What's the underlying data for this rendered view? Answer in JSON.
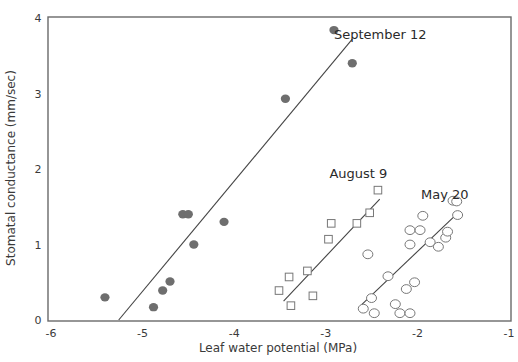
{
  "chart_data": {
    "type": "scatter",
    "title": "",
    "xlabel": "Leaf water potential (MPa)",
    "ylabel": "Stomatal conductance (mm/sec)",
    "xlim": [
      -6,
      -1
    ],
    "ylim": [
      0,
      4
    ],
    "xticks": [
      -6,
      -5,
      -4,
      -3,
      -2,
      -1
    ],
    "yticks": [
      0,
      1,
      2,
      3,
      4
    ],
    "xtick_labels": [
      "-6",
      "-5",
      "-4",
      "-3",
      "-2",
      "-1"
    ],
    "ytick_labels": [
      "0",
      "1",
      "2",
      "3",
      "4"
    ],
    "grid": false,
    "legend": "none (series labeled inline next to regression lines)",
    "series": [
      {
        "name": "September 12",
        "marker": "filled-circle",
        "color": "#6e6e6e",
        "label_pos": [
          -2.9,
          3.72
        ],
        "fit_line": [
          [
            -5.25,
            0.0
          ],
          [
            -2.7,
            3.72
          ]
        ],
        "points": [
          [
            -5.4,
            0.3
          ],
          [
            -4.87,
            0.17
          ],
          [
            -4.77,
            0.39
          ],
          [
            -4.69,
            0.51
          ],
          [
            -4.55,
            1.4
          ],
          [
            -4.49,
            1.4
          ],
          [
            -4.43,
            1.0
          ],
          [
            -4.1,
            1.3
          ],
          [
            -3.43,
            2.93
          ],
          [
            -2.9,
            3.84
          ],
          [
            -2.7,
            3.4
          ]
        ]
      },
      {
        "name": "August 9",
        "marker": "open-square",
        "color": "#777777",
        "label_pos": [
          -2.95,
          1.88
        ],
        "fit_line": [
          [
            -3.45,
            0.25
          ],
          [
            -2.4,
            1.6
          ]
        ],
        "points": [
          [
            -2.42,
            1.72
          ],
          [
            -2.51,
            1.42
          ],
          [
            -2.65,
            1.28
          ],
          [
            -2.93,
            1.28
          ],
          [
            -2.96,
            1.07
          ],
          [
            -3.19,
            0.65
          ],
          [
            -3.39,
            0.57
          ],
          [
            -3.13,
            0.32
          ],
          [
            -3.5,
            0.39
          ],
          [
            -3.37,
            0.19
          ]
        ]
      },
      {
        "name": "May 20",
        "marker": "open-circle",
        "color": "#777777",
        "label_pos": [
          -1.95,
          1.6
        ],
        "fit_line": [
          [
            -2.6,
            0.2
          ],
          [
            -1.58,
            1.38
          ]
        ],
        "points": [
          [
            -2.53,
            0.87
          ],
          [
            -2.31,
            0.58
          ],
          [
            -2.49,
            0.29
          ],
          [
            -2.58,
            0.15
          ],
          [
            -2.46,
            0.09
          ],
          [
            -2.23,
            0.21
          ],
          [
            -2.18,
            0.09
          ],
          [
            -2.07,
            0.09
          ],
          [
            -2.11,
            0.41
          ],
          [
            -2.02,
            0.5
          ],
          [
            -2.07,
            1.0
          ],
          [
            -2.07,
            1.19
          ],
          [
            -1.96,
            1.19
          ],
          [
            -1.93,
            1.38
          ],
          [
            -1.85,
            1.03
          ],
          [
            -1.76,
            0.97
          ],
          [
            -1.68,
            1.09
          ],
          [
            -1.66,
            1.17
          ],
          [
            -1.6,
            1.58
          ],
          [
            -1.56,
            1.57
          ],
          [
            -1.55,
            1.39
          ]
        ]
      }
    ]
  }
}
